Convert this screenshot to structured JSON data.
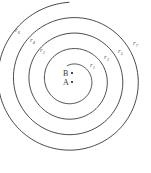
{
  "diagram": {
    "type": "archimedean-spiral",
    "stroke_color": "#333333",
    "label_color": "#555555",
    "spiral": {
      "center": [
        72,
        80
      ],
      "start_radius": 15,
      "growth_per_turn": 15.5,
      "start_angle_deg": -110,
      "turns": 4.05
    },
    "points": [
      {
        "name": "B",
        "x": 72,
        "y": 73
      },
      {
        "name": "A",
        "x": 72,
        "y": 82
      }
    ],
    "labels": [
      {
        "text": "r",
        "sub": "1",
        "x": 90,
        "y": 67
      },
      {
        "text": "r",
        "sub": "2",
        "x": 40,
        "y": 52
      },
      {
        "text": "r",
        "sub": "3",
        "x": 104,
        "y": 59
      },
      {
        "text": "r",
        "sub": "4",
        "x": 30,
        "y": 42
      },
      {
        "text": "r",
        "sub": "5",
        "x": 118,
        "y": 53
      },
      {
        "text": "r",
        "sub": "6",
        "x": 15,
        "y": 32
      },
      {
        "text": "r",
        "sub": "7",
        "x": 133,
        "y": 45
      }
    ]
  }
}
